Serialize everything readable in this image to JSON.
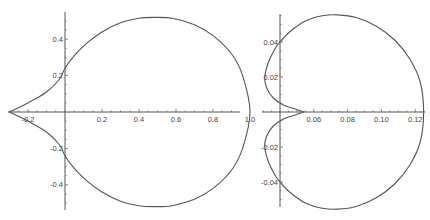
{
  "chart_data": [
    {
      "type": "line",
      "title": "",
      "xlabel": "",
      "ylabel": "",
      "grid": false,
      "legend": null,
      "xlim": [
        -0.3,
        1.0
      ],
      "ylim": [
        -0.55,
        0.55
      ],
      "x_ticks": [
        -0.2,
        0.2,
        0.4,
        0.6,
        0.8,
        1.0
      ],
      "x_tick_labels": [
        "-0.2",
        "0.2",
        "0.4",
        "0.6",
        "0.8",
        "1.0"
      ],
      "y_ticks": [
        -0.4,
        -0.2,
        0.2,
        0.4
      ],
      "y_tick_labels": [
        "-0.4",
        "-0.2",
        "0.2",
        "0.4"
      ],
      "series": [
        {
          "name": "closed curve (cusp at left)",
          "x": [
            -0.3,
            -0.2,
            -0.1,
            -0.03,
            0.0,
            0.05,
            0.12,
            0.2,
            0.3,
            0.4,
            0.48,
            0.58,
            0.7,
            0.8,
            0.9,
            0.96,
            1.0,
            0.96,
            0.9,
            0.8,
            0.7,
            0.58,
            0.48,
            0.4,
            0.3,
            0.2,
            0.12,
            0.05,
            0.0,
            -0.03,
            -0.1,
            -0.2,
            -0.3
          ],
          "y": [
            0.0,
            0.05,
            0.11,
            0.18,
            0.24,
            0.31,
            0.38,
            0.44,
            0.49,
            0.515,
            0.52,
            0.515,
            0.48,
            0.42,
            0.32,
            0.2,
            0.0,
            -0.2,
            -0.32,
            -0.42,
            -0.48,
            -0.515,
            -0.52,
            -0.515,
            -0.49,
            -0.44,
            -0.38,
            -0.31,
            -0.24,
            -0.18,
            -0.11,
            -0.05,
            0.0
          ]
        }
      ],
      "frame": {
        "x0": 10,
        "y_axis_px": 65,
        "x_axis_px": 112,
        "px_per_unit_x": 185,
        "px_per_unit_y": 182,
        "y_axis_top": 12,
        "y_axis_bottom": 210,
        "x_axis_left": 8,
        "x_axis_right": 240
      }
    },
    {
      "type": "line",
      "title": "",
      "xlabel": "",
      "ylabel": "",
      "grid": false,
      "legend": null,
      "xlim": [
        0.03,
        0.125
      ],
      "ylim": [
        -0.055,
        0.055
      ],
      "x_origin": 0.04,
      "x_ticks": [
        0.06,
        0.08,
        0.1,
        0.12
      ],
      "x_tick_labels": [
        "0.06",
        "0.08",
        "0.10",
        "0.12"
      ],
      "y_ticks": [
        -0.04,
        -0.02,
        0.02,
        0.04
      ],
      "y_tick_labels": [
        "-0.04",
        "-0.02",
        "0.02",
        "0.04"
      ],
      "series": [
        {
          "name": "closed curve (inward cusp)",
          "x": [
            0.054,
            0.048,
            0.042,
            0.036,
            0.032,
            0.031,
            0.033,
            0.037,
            0.04,
            0.046,
            0.055,
            0.065,
            0.074,
            0.085,
            0.097,
            0.108,
            0.117,
            0.123,
            0.125,
            0.123,
            0.117,
            0.108,
            0.097,
            0.085,
            0.074,
            0.065,
            0.055,
            0.046,
            0.04,
            0.037,
            0.033,
            0.031,
            0.032,
            0.036,
            0.042,
            0.048,
            0.054
          ],
          "y": [
            0.0,
            0.002,
            0.004,
            0.008,
            0.014,
            0.02,
            0.028,
            0.036,
            0.04,
            0.046,
            0.052,
            0.055,
            0.0555,
            0.054,
            0.049,
            0.041,
            0.03,
            0.017,
            0.0,
            -0.017,
            -0.03,
            -0.041,
            -0.049,
            -0.054,
            -0.0555,
            -0.055,
            -0.052,
            -0.046,
            -0.04,
            -0.036,
            -0.028,
            -0.02,
            -0.014,
            -0.008,
            -0.004,
            -0.002,
            0.0
          ]
        }
      ],
      "frame": {
        "y_axis_px": 280,
        "x_axis_px": 112,
        "px_per_unit_x": 1690,
        "px_per_unit_y": 1750,
        "y_axis_top": 14,
        "y_axis_bottom": 207,
        "x_axis_left": 262,
        "x_axis_right": 425
      }
    }
  ]
}
